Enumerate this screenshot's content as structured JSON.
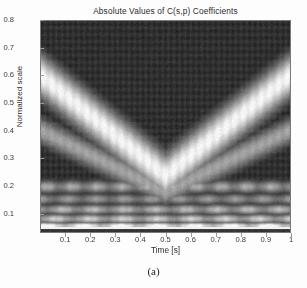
{
  "figure": {
    "title": "Absolute Values of C(s,p) Coefficients",
    "caption": "(a)"
  },
  "axes": {
    "xlabel": "Time [s]",
    "ylabel": "Normalized scale",
    "xticks": [
      "0.1",
      "0.2",
      "0.3",
      "0.4",
      "0.5",
      "0.6",
      "0.7",
      "0.8",
      "0.9",
      "1"
    ],
    "yticks": [
      "0.1",
      "0.2",
      "0.3",
      "0.4",
      "0.5",
      "0.6",
      "0.7",
      "0.8"
    ]
  },
  "colors": {
    "background": "#ffffff",
    "axis_text": "#3a3a3a",
    "title_text": "#2b2b2b",
    "plot_dark": "#1d1d1d",
    "plot_bright": "#f5f5f5",
    "frame": "#7a7a7a"
  },
  "chart_data": {
    "type": "heatmap",
    "title": "Absolute Values of C(s,p) Coefficients",
    "xlabel": "Time [s]",
    "ylabel": "Normalized scale",
    "colormap": "gray",
    "grid": false,
    "legend": null,
    "xlim": [
      0.0,
      1.0
    ],
    "ylim": [
      0.03,
      0.8
    ],
    "xticks": [
      0.1,
      0.2,
      0.3,
      0.4,
      0.5,
      0.6,
      0.7,
      0.8,
      0.9,
      1.0
    ],
    "yticks": [
      0.1,
      0.2,
      0.3,
      0.4,
      0.5,
      0.6,
      0.7,
      0.8
    ],
    "value_range": [
      0.0,
      1.0
    ],
    "features": {
      "symmetry_axis_time": 0.5,
      "ridge": {
        "shape": "v-chevron",
        "left_arm": {
          "start": {
            "t": 0.0,
            "s": 0.6
          },
          "end": {
            "t": 0.5,
            "s": 0.235
          }
        },
        "right_arm": {
          "start": {
            "t": 0.5,
            "s": 0.235
          },
          "end": {
            "t": 1.0,
            "s": 0.6
          }
        },
        "half_width_scale": 0.055,
        "peak_value": 1.0
      },
      "secondary_ridge": {
        "shape": "v-chevron",
        "left_arm": {
          "start": {
            "t": 0.0,
            "s": 0.4
          },
          "end": {
            "t": 0.5,
            "s": 0.175
          }
        },
        "right_arm": {
          "start": {
            "t": 0.5,
            "s": 0.175
          },
          "end": {
            "t": 1.0,
            "s": 0.4
          }
        },
        "half_width_scale": 0.035,
        "peak_value": 0.62
      },
      "horizontal_bands": [
        {
          "scale": 0.195,
          "value": 0.55,
          "half_width": 0.016
        },
        {
          "scale": 0.15,
          "value": 0.48,
          "half_width": 0.014
        },
        {
          "scale": 0.112,
          "value": 0.6,
          "half_width": 0.013
        },
        {
          "scale": 0.078,
          "value": 0.68,
          "half_width": 0.012
        },
        {
          "scale": 0.052,
          "value": 0.92,
          "half_width": 0.009
        }
      ],
      "bottom_strip": {
        "scale_range": [
          0.03,
          0.042
        ],
        "value": 0.12
      },
      "background_level": 0.09,
      "interference_texture": {
        "present": true,
        "amplitude": 0.07,
        "period_time": 0.045
      }
    },
    "x": [
      0.0,
      0.05,
      0.1,
      0.15,
      0.2,
      0.25,
      0.3,
      0.35,
      0.4,
      0.45,
      0.5,
      0.55,
      0.6,
      0.65,
      0.7,
      0.75,
      0.8,
      0.85,
      0.9,
      0.95,
      1.0
    ],
    "y": [
      0.05,
      0.1,
      0.15,
      0.2,
      0.25,
      0.3,
      0.35,
      0.4,
      0.45,
      0.5,
      0.55,
      0.6,
      0.65,
      0.7,
      0.75,
      0.8
    ],
    "ridge_scale_vs_time": [
      0.6,
      0.563,
      0.527,
      0.49,
      0.454,
      0.417,
      0.381,
      0.344,
      0.308,
      0.271,
      0.235,
      0.271,
      0.308,
      0.344,
      0.381,
      0.417,
      0.454,
      0.49,
      0.527,
      0.563,
      0.6
    ]
  }
}
